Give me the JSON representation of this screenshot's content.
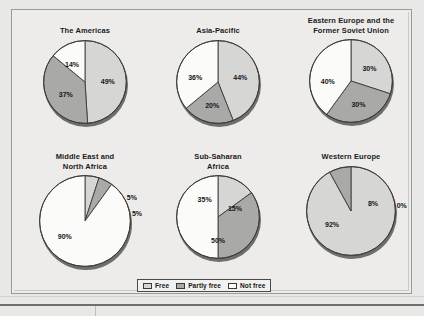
{
  "figure": {
    "background_color": "#e8e8e6",
    "panel_color": "#edecea"
  },
  "legend": {
    "items": [
      {
        "label": "Free",
        "color": "#d6d6d4",
        "swatch_name": "legend-swatch-free"
      },
      {
        "label": "Partly free",
        "color": "#a9a9a7",
        "swatch_name": "legend-swatch-partly-free"
      },
      {
        "label": "Not free",
        "color": "#fbfbfa",
        "swatch_name": "legend-swatch-not-free"
      }
    ]
  },
  "chart_data": [
    {
      "type": "pie",
      "title": "The Americas",
      "categories": [
        "Free",
        "Partly free",
        "Not free"
      ],
      "values": [
        49,
        37,
        14
      ],
      "labels": [
        "49%",
        "37%",
        "14%"
      ],
      "colors": [
        "#d6d6d4",
        "#a9a9a7",
        "#fbfbfa"
      ],
      "start_angle": 0
    },
    {
      "type": "pie",
      "title": "Asia-Pacific",
      "categories": [
        "Free",
        "Partly free",
        "Not free"
      ],
      "values": [
        44,
        20,
        36
      ],
      "labels": [
        "44%",
        "20%",
        "36%"
      ],
      "colors": [
        "#d6d6d4",
        "#a9a9a7",
        "#fbfbfa"
      ],
      "start_angle": 0
    },
    {
      "type": "pie",
      "title": "Eastern Europe and the\nFormer Soviet Union",
      "categories": [
        "Free",
        "Partly free",
        "Not free"
      ],
      "values": [
        30,
        30,
        40
      ],
      "labels": [
        "30%",
        "30%",
        "40%"
      ],
      "colors": [
        "#d6d6d4",
        "#a9a9a7",
        "#fbfbfa"
      ],
      "start_angle": 0
    },
    {
      "type": "pie",
      "title": "Middle East and\nNorth Africa",
      "categories": [
        "Free",
        "Partly free",
        "Not free"
      ],
      "values": [
        5,
        5,
        90
      ],
      "labels": [
        "5%",
        "5%",
        "90%"
      ],
      "colors": [
        "#d6d6d4",
        "#a9a9a7",
        "#fbfbfa"
      ],
      "start_angle": 0
    },
    {
      "type": "pie",
      "title": "Sub-Saharan\nAfrica",
      "categories": [
        "Free",
        "Partly free",
        "Not free"
      ],
      "values": [
        15,
        35,
        50
      ],
      "labels": [
        "15%",
        "35%",
        "50%"
      ],
      "colors": [
        "#d6d6d4",
        "#a9a9a7",
        "#fbfbfa"
      ],
      "start_angle": 0
    },
    {
      "type": "pie",
      "title": "Western Europe",
      "categories": [
        "Free",
        "Partly free",
        "Not free"
      ],
      "values": [
        92,
        8,
        0
      ],
      "labels": [
        "92%",
        "8%",
        "0%"
      ],
      "colors": [
        "#d6d6d4",
        "#a9a9a7",
        "#fbfbfa"
      ],
      "start_angle": 0
    }
  ],
  "layout": {
    "cells": [
      {
        "left": 22,
        "top": 26,
        "width": 126,
        "height": 120,
        "radius": 42,
        "title_lines": 1
      },
      {
        "left": 155,
        "top": 26,
        "width": 126,
        "height": 120,
        "radius": 42,
        "title_lines": 1
      },
      {
        "left": 288,
        "top": 16,
        "width": 126,
        "height": 130,
        "radius": 42,
        "title_lines": 2
      },
      {
        "left": 22,
        "top": 152,
        "width": 126,
        "height": 126,
        "radius": 46,
        "title_lines": 2
      },
      {
        "left": 155,
        "top": 152,
        "width": 126,
        "height": 126,
        "radius": 42,
        "title_lines": 2
      },
      {
        "left": 288,
        "top": 152,
        "width": 126,
        "height": 126,
        "radius": 45,
        "title_lines": 1
      }
    ],
    "label_offsets": [
      [
        {
          "r": 0.55,
          "a": 88,
          "dx": 0,
          "dy": 0
        },
        {
          "r": 0.56,
          "a": 236,
          "dx": 0,
          "dy": 0
        },
        {
          "r": 0.52,
          "a": 323,
          "dx": 0,
          "dy": 0
        }
      ],
      [
        {
          "r": 0.55,
          "a": 79,
          "dx": 0,
          "dy": 0
        },
        {
          "r": 0.58,
          "a": 194,
          "dx": 0,
          "dy": 0
        },
        {
          "r": 0.56,
          "a": 281,
          "dx": 0,
          "dy": 0
        }
      ],
      [
        {
          "r": 0.55,
          "a": 54,
          "dx": 0,
          "dy": 0
        },
        {
          "r": 0.58,
          "a": 162,
          "dx": 0,
          "dy": 0
        },
        {
          "r": 0.56,
          "a": 270,
          "dx": 0,
          "dy": 0
        }
      ],
      [
        {
          "r": 1.16,
          "a": 81,
          "dx": 0,
          "dy": 0
        },
        {
          "r": 1.16,
          "a": 63,
          "dx": 0,
          "dy": 0
        },
        {
          "r": 0.55,
          "a": 234,
          "dx": 0,
          "dy": 0
        }
      ],
      [
        {
          "r": 0.46,
          "a": 63,
          "dx": 0,
          "dy": 0
        },
        {
          "r": 0.55,
          "a": 324,
          "dx": 0,
          "dy": 0
        },
        {
          "r": 0.56,
          "a": 180,
          "dx": 0,
          "dy": 0
        }
      ],
      [
        {
          "r": 0.52,
          "a": 235,
          "dx": 0,
          "dy": 0
        },
        {
          "r": 0.52,
          "a": 72,
          "dx": 0,
          "dy": 0
        },
        {
          "r": 1.15,
          "a": 84,
          "dx": 0,
          "dy": 0
        }
      ]
    ]
  }
}
